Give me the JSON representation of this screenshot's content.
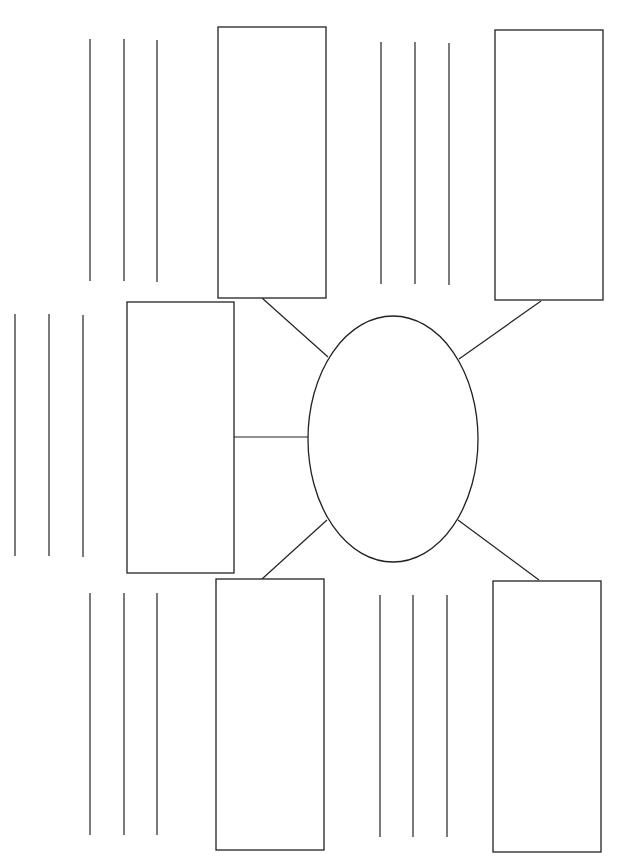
{
  "diagram": {
    "type": "graphic-organizer",
    "center": {
      "shape": "oval",
      "text": ""
    },
    "branches": [
      {
        "id": "top-left",
        "text": "",
        "writing_lines": 3
      },
      {
        "id": "top-right",
        "text": "",
        "writing_lines": 3
      },
      {
        "id": "middle-left",
        "text": "",
        "writing_lines": 3
      },
      {
        "id": "bottom-left",
        "text": "",
        "writing_lines": 3
      },
      {
        "id": "bottom-right",
        "text": "",
        "writing_lines": 3
      }
    ],
    "colors": {
      "stroke": "#222222",
      "background": "#ffffff"
    }
  }
}
